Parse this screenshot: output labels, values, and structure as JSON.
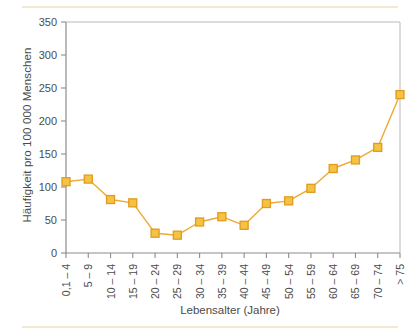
{
  "figure": {
    "background_color": "#ffffff",
    "rule_color": "#f2ead0",
    "axis_color": "#8c8c8c",
    "text_color": "#4b4b4b"
  },
  "chart_data": {
    "type": "line",
    "title": "",
    "subtitle": "",
    "xlabel": "Lebensalter (Jahre)",
    "ylabel": "Häufigkeit pro 100 000 Menschen",
    "categories": [
      "0,1 – 4",
      "5 – 9",
      "10 – 14",
      "15 – 19",
      "20 – 24",
      "25 – 29",
      "30 – 34",
      "35 – 39",
      "40 – 44",
      "45 – 49",
      "50 – 54",
      "55 – 59",
      "60 – 64",
      "65 – 69",
      "70 – 74",
      "> 75"
    ],
    "values": [
      108,
      112,
      81,
      76,
      30,
      27,
      47,
      55,
      42,
      75,
      79,
      98,
      128,
      141,
      160,
      240
    ],
    "ylim": [
      0,
      350
    ],
    "yticks": [
      0,
      50,
      100,
      150,
      200,
      250,
      300,
      350
    ],
    "ytick_labels": [
      "0",
      "50",
      "100",
      "150",
      "200",
      "250",
      "300",
      "350"
    ],
    "grid": false,
    "legend": null,
    "legend_position": "none",
    "marker": "square",
    "series_color": "#f0a830",
    "marker_fill": "#f5c242",
    "marker_edge": "#e09b20",
    "line_width": 1.4,
    "annotations": []
  }
}
